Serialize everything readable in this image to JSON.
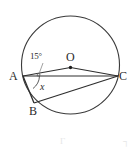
{
  "figure": {
    "shape": "circle",
    "stroke_color": "#3a3a3a",
    "label_color": "#2b2b2b",
    "background_color": "#ffffff",
    "circle": {
      "center_label": "O",
      "center_x": 70.5,
      "center_y": 65.0,
      "radius": 49.0
    },
    "points": [
      {
        "name": "A",
        "label": "A",
        "x": 23.0,
        "y": 76.0,
        "label_x": 9,
        "label_y": 70
      },
      {
        "name": "B",
        "label": "B",
        "x": 34.0,
        "y": 103.0,
        "label_x": 29,
        "label_y": 105
      },
      {
        "name": "C",
        "label": "C",
        "x": 118.0,
        "y": 76.0,
        "label_x": 119,
        "label_y": 70
      },
      {
        "name": "O",
        "label": "O",
        "x": 70.5,
        "y": 67.5,
        "label_x": 66,
        "label_y": 51
      }
    ],
    "segments": [
      {
        "name": "segment-AO",
        "from": "A",
        "to": "O"
      },
      {
        "name": "segment-OC",
        "from": "O",
        "to": "C"
      },
      {
        "name": "segment-AC",
        "from": "A",
        "to": "C"
      },
      {
        "name": "segment-AB",
        "from": "A",
        "to": "B"
      },
      {
        "name": "segment-BC",
        "from": "B",
        "to": "C"
      }
    ],
    "angles": [
      {
        "name": "angle-OAC",
        "label": "15°",
        "vertex": "A",
        "label_x": 30,
        "label_y": 52,
        "mark": "small-arc"
      },
      {
        "name": "angle-BAC",
        "label": "x",
        "vertex": "A",
        "label_x": 40,
        "label_y": 82,
        "mark": "arc"
      }
    ],
    "faint_marks": {
      "left": "Γ",
      "right": "┐"
    }
  }
}
